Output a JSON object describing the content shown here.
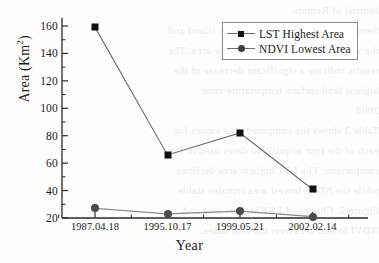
{
  "chart_data": {
    "type": "line",
    "title": "",
    "xlabel": "Year",
    "ylabel": "Area (Km2)",
    "ylabel_base": "Area (Km",
    "ylabel_sup": "2",
    "ylabel_close": ")",
    "categories": [
      "1987.04.18",
      "1995.10.17",
      "1999.05.21",
      "2002.02.14"
    ],
    "ylim": [
      20,
      160
    ],
    "yticks": [
      20,
      40,
      60,
      80,
      100,
      120,
      140,
      160
    ],
    "grid": false,
    "legend_position": "top-right",
    "series": [
      {
        "name": "LST Highest Area",
        "marker": "square",
        "color": "#111111",
        "line_color": "#6e6e6e",
        "values": [
          159,
          66,
          82,
          41
        ]
      },
      {
        "name": "NDVI Lowest Area",
        "marker": "circle",
        "color": "#4a4a4a",
        "line_color": "#8a8a8a",
        "values": [
          27,
          23,
          25,
          21
        ]
      }
    ]
  },
  "axes": {
    "ytick_labels": [
      "160",
      "140",
      "120",
      "100",
      "80",
      "60",
      "40",
      "20"
    ],
    "xtick_labels": [
      "1987.04.18",
      "1995.10.17",
      "1999.05.21",
      "2002.02.14"
    ]
  },
  "legend": {
    "items": [
      {
        "label": "LST Highest Area"
      },
      {
        "label": "NDVI Lowest Area"
      }
    ]
  },
  "bleed_lines": [
    "Journal of Remote",
    "Sensing analysis of the urban heat island and",
    "the vegetation index over the study area. The",
    "results indicate a significant decrease of the",
    "highest land surface temperature zone.",
    "2003",
    "Table 3 shows the computed area values for",
    "each of the four acquisition dates used in the",
    "comparison. The LST highest area declines",
    "while the NDVI lowest area remains stable.",
    "",
    "Figure 5. Change of LST highest area and",
    "NDVI lowest area over the four dates."
  ],
  "colors": {
    "background": "#fdfdfb",
    "axis": "#2a2a2a",
    "series_1": "#111111",
    "series_2": "#4a4a4a"
  }
}
